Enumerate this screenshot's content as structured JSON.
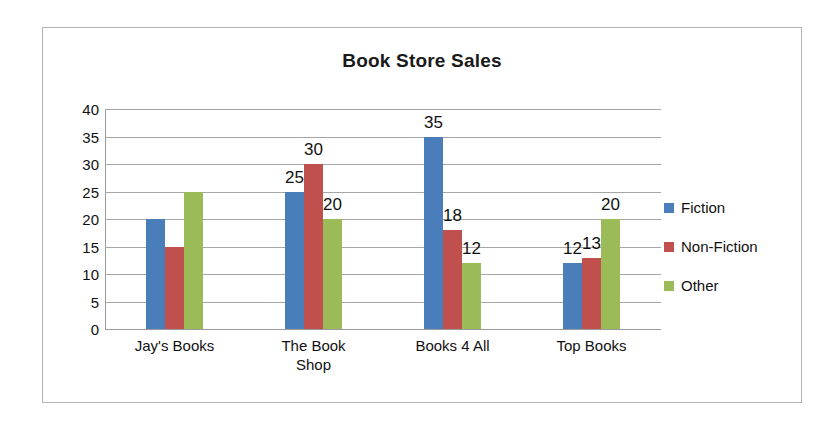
{
  "chart_data": {
    "type": "bar",
    "title": "Book Store Sales",
    "xlabel": "",
    "ylabel": "",
    "ylim": [
      0,
      40
    ],
    "ytick_step": 5,
    "yticks": [
      "40",
      "35",
      "30",
      "25",
      "20",
      "15",
      "10",
      "5",
      "0"
    ],
    "grid": true,
    "legend_position": "right",
    "categories": [
      "Jay's Books",
      "The Book\nShop",
      "Books 4 All",
      "Top Books"
    ],
    "series": [
      {
        "name": "Fiction",
        "color": "#4a7ebb",
        "values": [
          20,
          25,
          35,
          12
        ],
        "labels": [
          "",
          "25",
          "35",
          "12"
        ]
      },
      {
        "name": "Non-Fiction",
        "color": "#c0504d",
        "values": [
          15,
          30,
          18,
          13
        ],
        "labels": [
          "",
          "30",
          "18",
          "13"
        ]
      },
      {
        "name": "Other",
        "color": "#9bbb59",
        "values": [
          25,
          20,
          12,
          20
        ],
        "labels": [
          "",
          "20",
          "12",
          "20"
        ]
      }
    ]
  },
  "frame": {
    "border_color": "#b3b3b3",
    "background": "#ffffff"
  }
}
